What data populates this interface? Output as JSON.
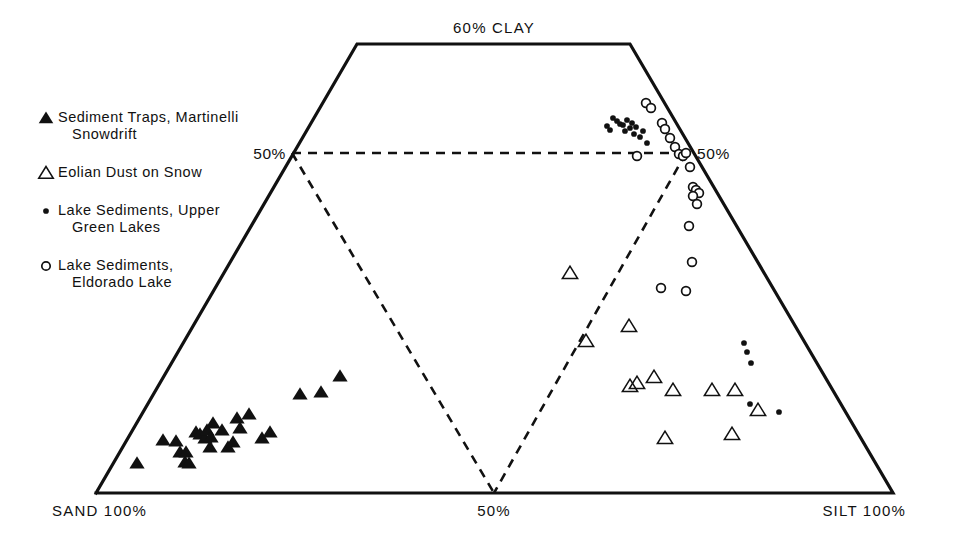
{
  "chart_data": {
    "type": "scatter",
    "title": "",
    "diagram_kind": "ternary-texture-trapezoid",
    "apex_label": "60% CLAY",
    "xlabel_left": "SAND 100%",
    "xlabel_center": "50%",
    "xlabel_right": "SILT 100%",
    "tick_left": "50%",
    "tick_right": "50%",
    "axis_note": "Clay axis truncated at 60%; dashed lines mark 50% sand and 50% silt boundaries",
    "grid": false,
    "legend_position": "upper-left",
    "legend": [
      {
        "marker": "filled-triangle",
        "label": "Sediment Traps, Martinelli",
        "label2": "Snowdrift"
      },
      {
        "marker": "open-triangle",
        "label": "Eolian Dust on Snow",
        "label2": ""
      },
      {
        "marker": "dot",
        "label": "Lake Sediments, Upper",
        "label2": "Green Lakes"
      },
      {
        "marker": "open-circle",
        "label": "Lake Sediments,",
        "label2": "Eldorado Lake"
      }
    ],
    "geometry": {
      "top_left": [
        357,
        44
      ],
      "top_right": [
        630,
        44
      ],
      "bottom_left": [
        96,
        493
      ],
      "bottom_right": [
        893,
        493
      ],
      "dash_apex": [
        494,
        493
      ],
      "dash_left_tick": [
        292,
        153
      ],
      "dash_right_tick": [
        686,
        153
      ]
    },
    "series": [
      {
        "name": "Sediment Traps, Martinelli Snowdrift",
        "marker": "filled-triangle",
        "points": [
          [
            137,
            463
          ],
          [
            163,
            440
          ],
          [
            176,
            441
          ],
          [
            180,
            452
          ],
          [
            185,
            462
          ],
          [
            186,
            452
          ],
          [
            189,
            463
          ],
          [
            196,
            432
          ],
          [
            200,
            434
          ],
          [
            205,
            438
          ],
          [
            207,
            430
          ],
          [
            210,
            447
          ],
          [
            211,
            437
          ],
          [
            213,
            423
          ],
          [
            222,
            430
          ],
          [
            228,
            447
          ],
          [
            233,
            442
          ],
          [
            237,
            418
          ],
          [
            240,
            428
          ],
          [
            249,
            414
          ],
          [
            262,
            438
          ],
          [
            270,
            432
          ],
          [
            300,
            394
          ],
          [
            321,
            392
          ],
          [
            340,
            376
          ]
        ]
      },
      {
        "name": "Eolian Dust on Snow",
        "marker": "open-triangle",
        "points": [
          [
            570,
            273
          ],
          [
            586,
            341
          ],
          [
            629,
            326
          ],
          [
            630,
            386
          ],
          [
            637,
            383
          ],
          [
            654,
            377
          ],
          [
            665,
            438
          ],
          [
            673,
            390
          ],
          [
            712,
            390
          ],
          [
            732,
            434
          ],
          [
            735,
            390
          ],
          [
            758,
            410
          ]
        ]
      },
      {
        "name": "Lake Sediments, Upper Green Lakes",
        "marker": "dot",
        "points": [
          [
            613,
            118
          ],
          [
            617,
            121
          ],
          [
            620,
            124
          ],
          [
            623,
            125
          ],
          [
            625,
            131
          ],
          [
            627,
            120
          ],
          [
            630,
            128
          ],
          [
            632,
            123
          ],
          [
            634,
            134
          ],
          [
            636,
            127
          ],
          [
            640,
            137
          ],
          [
            643,
            131
          ],
          [
            647,
            143
          ],
          [
            744,
            343
          ],
          [
            747,
            352
          ],
          [
            751,
            363
          ],
          [
            750,
            404
          ],
          [
            779,
            412
          ],
          [
            607,
            126
          ],
          [
            610,
            130
          ]
        ]
      },
      {
        "name": "Lake Sediments, Eldorado Lake",
        "marker": "open-circle",
        "points": [
          [
            646,
            103
          ],
          [
            651,
            108
          ],
          [
            662,
            123
          ],
          [
            665,
            129
          ],
          [
            670,
            138
          ],
          [
            675,
            147
          ],
          [
            679,
            154
          ],
          [
            683,
            156
          ],
          [
            686,
            153
          ],
          [
            637,
            156
          ],
          [
            690,
            167
          ],
          [
            693,
            187
          ],
          [
            696,
            190
          ],
          [
            699,
            193
          ],
          [
            693,
            196
          ],
          [
            697,
            204
          ],
          [
            689,
            226
          ],
          [
            692,
            262
          ],
          [
            686,
            291
          ],
          [
            661,
            288
          ]
        ]
      }
    ]
  }
}
